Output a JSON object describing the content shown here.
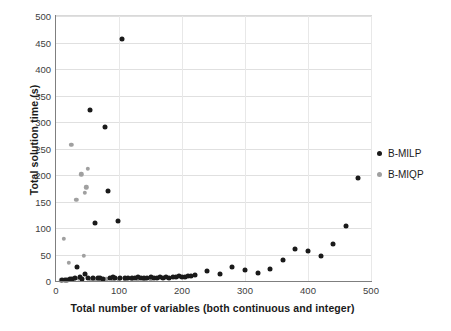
{
  "chart_data": {
    "type": "scatter",
    "title": "",
    "xlabel": "Total number of variables (both continuous and integer)",
    "ylabel": "Total solution time (s)",
    "xlim": [
      0,
      500
    ],
    "ylim": [
      0,
      500
    ],
    "xticks": [
      0,
      100,
      200,
      300,
      400,
      500
    ],
    "yticks": [
      0,
      50,
      100,
      150,
      200,
      250,
      300,
      350,
      400,
      450,
      500
    ],
    "grid": "horizontal-and-vertical",
    "legend_position": "right",
    "colors": {
      "B-MILP": "#1a1a1a",
      "B-MIQP": "#a0a0a0",
      "gridline": "#e0e0e0",
      "axis": "#7f7f7f",
      "text": "#1a1a1a",
      "tick_text": "#404040",
      "background": "#ffffff"
    },
    "series": [
      {
        "name": "B-MILP",
        "marker": "circle",
        "color": "#1a1a1a",
        "points": [
          [
            10,
            1
          ],
          [
            14,
            2
          ],
          [
            18,
            2
          ],
          [
            22,
            3
          ],
          [
            26,
            4
          ],
          [
            30,
            5
          ],
          [
            34,
            26
          ],
          [
            38,
            8
          ],
          [
            42,
            4
          ],
          [
            46,
            13
          ],
          [
            50,
            5
          ],
          [
            54,
            323
          ],
          [
            58,
            6
          ],
          [
            62,
            109
          ],
          [
            66,
            5
          ],
          [
            70,
            6
          ],
          [
            74,
            4
          ],
          [
            78,
            291
          ],
          [
            82,
            170
          ],
          [
            86,
            5
          ],
          [
            90,
            7
          ],
          [
            94,
            6
          ],
          [
            98,
            113
          ],
          [
            102,
            5
          ],
          [
            105,
            456
          ],
          [
            110,
            6
          ],
          [
            115,
            6
          ],
          [
            120,
            5
          ],
          [
            125,
            6
          ],
          [
            130,
            7
          ],
          [
            135,
            5
          ],
          [
            140,
            6
          ],
          [
            145,
            5
          ],
          [
            150,
            7
          ],
          [
            155,
            6
          ],
          [
            160,
            6
          ],
          [
            165,
            7
          ],
          [
            170,
            6
          ],
          [
            175,
            7
          ],
          [
            180,
            6
          ],
          [
            185,
            8
          ],
          [
            190,
            7
          ],
          [
            195,
            9
          ],
          [
            200,
            8
          ],
          [
            205,
            8
          ],
          [
            210,
            9
          ],
          [
            215,
            9
          ],
          [
            220,
            11
          ],
          [
            240,
            19
          ],
          [
            260,
            13
          ],
          [
            280,
            26
          ],
          [
            300,
            20
          ],
          [
            320,
            16
          ],
          [
            340,
            22
          ],
          [
            360,
            39
          ],
          [
            380,
            61
          ],
          [
            400,
            57
          ],
          [
            420,
            47
          ],
          [
            440,
            69
          ],
          [
            460,
            103
          ],
          [
            480,
            195
          ]
        ]
      },
      {
        "name": "B-MIQP",
        "marker": "circle",
        "color": "#a0a0a0",
        "points": [
          [
            8,
            1
          ],
          [
            12,
            80
          ],
          [
            16,
            2
          ],
          [
            20,
            34
          ],
          [
            24,
            257
          ],
          [
            28,
            3
          ],
          [
            32,
            153
          ],
          [
            36,
            4
          ],
          [
            40,
            201
          ],
          [
            44,
            48
          ],
          [
            46,
            166
          ],
          [
            48,
            177
          ],
          [
            50,
            212
          ],
          [
            56,
            3
          ],
          [
            60,
            2
          ],
          [
            64,
            3
          ],
          [
            70,
            2
          ],
          [
            80,
            3
          ],
          [
            90,
            2
          ],
          [
            100,
            3
          ],
          [
            110,
            2
          ],
          [
            120,
            2
          ],
          [
            130,
            3
          ],
          [
            140,
            2
          ],
          [
            150,
            2
          ]
        ]
      }
    ]
  },
  "legend": {
    "items": [
      {
        "label": "B-MILP",
        "key": "milp"
      },
      {
        "label": "B-MIQP",
        "key": "miqp"
      }
    ]
  }
}
